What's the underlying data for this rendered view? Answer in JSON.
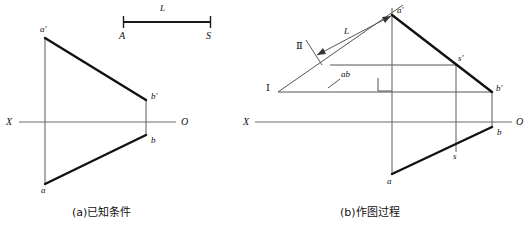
{
  "figure": {
    "background_color": "#ffffff",
    "ink_color": "#1a1a1a",
    "thin_line_color": "#555555"
  },
  "panel_a": {
    "caption": "(a)已知条件",
    "scale_bar": {
      "length_label": "L",
      "start_label": "A",
      "end_label": "S"
    },
    "axis": {
      "left_label": "X",
      "right_label": "O"
    },
    "points": [
      {
        "id": "a-prime",
        "label": "a'",
        "x": 45,
        "y": 38
      },
      {
        "id": "b-prime",
        "label": "b'",
        "x": 146,
        "y": 100
      },
      {
        "id": "b",
        "label": "b",
        "x": 146,
        "y": 135
      },
      {
        "id": "a",
        "label": "a",
        "x": 45,
        "y": 184
      }
    ]
  },
  "panel_b": {
    "caption": "(b)作图过程",
    "axis": {
      "left_label": "X",
      "right_label": "O"
    },
    "dimension": {
      "length_label": "L",
      "marker_label": "Ⅱ"
    },
    "roman_one_label": "Ⅰ",
    "projection_label": "ab",
    "points": [
      {
        "id": "a-prime",
        "label": "a'",
        "x": 392,
        "y": 15
      },
      {
        "id": "s-prime",
        "label": "s'",
        "x": 456,
        "y": 65
      },
      {
        "id": "b-prime",
        "label": "b'",
        "x": 492,
        "y": 92
      },
      {
        "id": "b",
        "label": "b",
        "x": 492,
        "y": 127
      },
      {
        "id": "s",
        "label": "s",
        "x": 456,
        "y": 152
      },
      {
        "id": "a",
        "label": "a",
        "x": 392,
        "y": 174
      }
    ]
  }
}
